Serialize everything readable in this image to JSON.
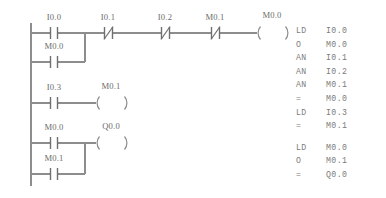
{
  "diagram": {
    "type": "plc-ladder-logic",
    "rungs": [
      {
        "id": "rung-1",
        "contacts": [
          {
            "label": "I0.0",
            "kind": "normally-open"
          },
          {
            "label": "I0.1",
            "kind": "normally-closed"
          },
          {
            "label": "I0.2",
            "kind": "normally-closed"
          },
          {
            "label": "M0.1",
            "kind": "normally-closed"
          }
        ],
        "branch": [
          {
            "label": "M0.0",
            "kind": "normally-open"
          }
        ],
        "coil": {
          "label": "M0.0"
        }
      },
      {
        "id": "rung-2",
        "contacts": [
          {
            "label": "I0.3",
            "kind": "normally-open"
          }
        ],
        "branch": [],
        "coil": {
          "label": "M0.1"
        }
      },
      {
        "id": "rung-3",
        "contacts": [
          {
            "label": "M0.0",
            "kind": "normally-open"
          }
        ],
        "branch": [
          {
            "label": "M0.1",
            "kind": "normally-open"
          }
        ],
        "coil": {
          "label": "Q0.0"
        }
      }
    ]
  },
  "statement_list": {
    "lines": [
      {
        "op": "LD",
        "arg": "I0.0"
      },
      {
        "op": "O",
        "arg": "M0.0"
      },
      {
        "op": "AN",
        "arg": "I0.1"
      },
      {
        "op": "AN",
        "arg": "I0.2"
      },
      {
        "op": "AN",
        "arg": "M0.1"
      },
      {
        "op": "=",
        "arg": "M0.0"
      },
      {
        "op": "LD",
        "arg": "I0.3"
      },
      {
        "op": "=",
        "arg": "M0.1"
      },
      {
        "op": "",
        "arg": ""
      },
      {
        "op": "LD",
        "arg": "M0.0"
      },
      {
        "op": "O",
        "arg": "M0.1"
      },
      {
        "op": "=",
        "arg": "Q0.0"
      }
    ]
  },
  "colors": {
    "line": "#8d8d8d",
    "contact": "#6f6f6f",
    "text": "#6b6b6b",
    "code_text": "#7b7b7b",
    "background": "#ffffff"
  }
}
